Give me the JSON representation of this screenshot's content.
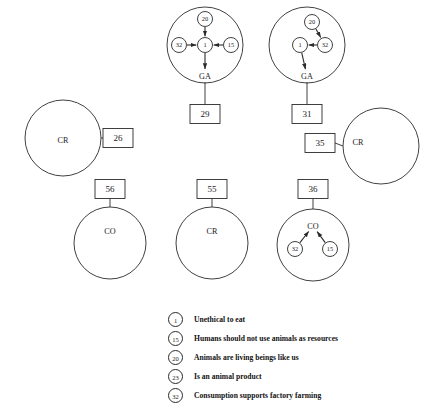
{
  "diagram": {
    "type": "concept-map",
    "node_radius": 7.5,
    "clusters": [
      {
        "id": "cluster-ga-1",
        "shape": "circle",
        "cx": 205,
        "cy": 45,
        "r": 38,
        "anchor_label": "GA",
        "anchor_x": 205,
        "anchor_y": 76,
        "nodes": [
          {
            "id": "n1",
            "label": "20",
            "x": 205,
            "y": 19
          },
          {
            "id": "n2",
            "label": "32",
            "x": 179,
            "y": 45
          },
          {
            "id": "n3",
            "label": "1",
            "x": 205,
            "y": 45
          },
          {
            "id": "n4",
            "label": "15",
            "x": 231,
            "y": 45
          }
        ],
        "edges": [
          {
            "from": "n1",
            "to": "n3"
          },
          {
            "from": "n2",
            "to": "n3"
          },
          {
            "from": "n4",
            "to": "n3"
          },
          {
            "from": "n3",
            "to": "anchor"
          }
        ],
        "box": {
          "label": "29",
          "x": 205,
          "y": 114
        }
      },
      {
        "id": "cluster-ga-2",
        "shape": "circle",
        "cx": 307,
        "cy": 45,
        "r": 38,
        "anchor_label": "GA",
        "anchor_x": 307,
        "anchor_y": 76,
        "nodes": [
          {
            "id": "m1",
            "label": "20",
            "x": 312,
            "y": 22
          },
          {
            "id": "m2",
            "label": "32",
            "x": 325,
            "y": 45
          },
          {
            "id": "m3",
            "label": "1",
            "x": 300,
            "y": 45
          }
        ],
        "edges": [
          {
            "from": "m1",
            "to": "m2"
          },
          {
            "from": "m2",
            "to": "m3"
          },
          {
            "from": "m3",
            "to": "anchor"
          }
        ],
        "box": {
          "label": "31",
          "x": 307,
          "y": 114
        }
      },
      {
        "id": "cluster-cr-left",
        "shape": "circle",
        "cx": 63,
        "cy": 138,
        "r": 38,
        "anchor_label": "CR",
        "anchor_x": 63,
        "anchor_y": 140,
        "nodes": [],
        "edges": [],
        "box": {
          "label": "26",
          "x": 118,
          "y": 138
        },
        "connector": "right"
      },
      {
        "id": "cluster-cr-right",
        "shape": "circle",
        "cx": 381,
        "cy": 146,
        "r": 38,
        "anchor_label": "CR",
        "anchor_x": 358,
        "anchor_y": 142,
        "nodes": [],
        "edges": [],
        "box": {
          "label": "35",
          "x": 320,
          "y": 143
        },
        "connector": "left"
      },
      {
        "id": "cluster-co-left",
        "shape": "circle",
        "cx": 110,
        "cy": 243,
        "r": 36,
        "anchor_label": "CO",
        "anchor_x": 110,
        "anchor_y": 231,
        "nodes": [],
        "edges": [],
        "box": {
          "label": "56",
          "x": 110,
          "y": 189
        },
        "connector": "top"
      },
      {
        "id": "cluster-cr-bottom",
        "shape": "circle",
        "cx": 212,
        "cy": 243,
        "r": 36,
        "anchor_label": "CR",
        "anchor_x": 212,
        "anchor_y": 231,
        "nodes": [],
        "edges": [],
        "box": {
          "label": "55",
          "x": 212,
          "y": 189
        },
        "connector": "top"
      },
      {
        "id": "cluster-co-right",
        "shape": "circle",
        "cx": 313,
        "cy": 245,
        "r": 36,
        "anchor_label": "CO",
        "anchor_x": 313,
        "anchor_y": 226,
        "nodes": [
          {
            "id": "p1",
            "label": "32",
            "x": 295,
            "y": 249
          },
          {
            "id": "p2",
            "label": "15",
            "x": 330,
            "y": 249
          }
        ],
        "edges": [
          {
            "from": "p1",
            "to": "anchor"
          },
          {
            "from": "p2",
            "to": "anchor"
          }
        ],
        "box": {
          "label": "36",
          "x": 313,
          "y": 189
        },
        "connector": "top"
      }
    ]
  },
  "legend": {
    "items": [
      {
        "id": "1",
        "text": "Unethical to eat"
      },
      {
        "id": "15",
        "text": "Humans should not use animals as resources"
      },
      {
        "id": "20",
        "text": "Animals are living beings like us"
      },
      {
        "id": "23",
        "text": "Is an animal product"
      },
      {
        "id": "32",
        "text": "Consumption supports factory farming"
      }
    ]
  },
  "style": {
    "stroke": "#2b2b2b",
    "fill": "#ffffff",
    "text": "#1a1a1a"
  }
}
